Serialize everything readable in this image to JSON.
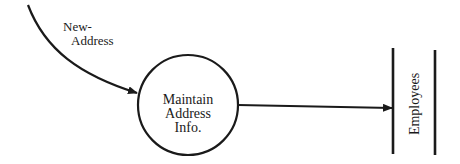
{
  "diagram": {
    "type": "data-flow-diagram",
    "input_flow": {
      "label_line1": "New-",
      "label_line2": "Address"
    },
    "process": {
      "line1": "Maintain",
      "line2": "Address",
      "line3": "Info."
    },
    "data_store": {
      "label": "Employees"
    },
    "colors": {
      "stroke": "#1a1a1a",
      "background": "#ffffff"
    }
  }
}
